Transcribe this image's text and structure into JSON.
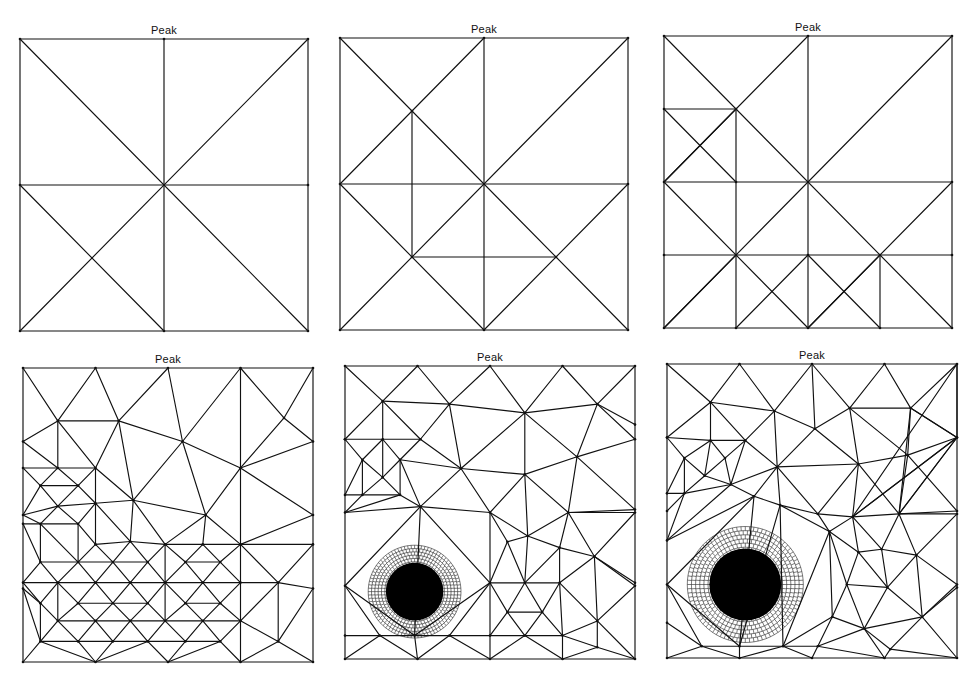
{
  "figure": {
    "panels": [
      {
        "id": 1,
        "title": "Peak",
        "box": {
          "left": 20,
          "top": 39,
          "width": 288,
          "height": 292
        },
        "edges": [
          [
            0,
            0,
            1,
            0
          ],
          [
            1,
            0,
            1,
            1
          ],
          [
            1,
            1,
            0,
            1
          ],
          [
            0,
            1,
            0,
            0
          ],
          [
            0.5,
            0,
            0.5,
            1
          ],
          [
            0,
            0.5,
            1,
            0.5
          ],
          [
            0,
            0,
            1,
            1
          ],
          [
            1,
            0,
            0,
            1
          ],
          [
            0,
            0.5,
            0.5,
            1
          ]
        ]
      },
      {
        "id": 2,
        "title": "Peak",
        "box": {
          "left": 340,
          "top": 38,
          "width": 288,
          "height": 292
        },
        "edges": [
          [
            0,
            0,
            1,
            0
          ],
          [
            1,
            0,
            1,
            1
          ],
          [
            1,
            1,
            0,
            1
          ],
          [
            0,
            1,
            0,
            0
          ],
          [
            0.5,
            0,
            0.5,
            1
          ],
          [
            0,
            0.5,
            1,
            0.5
          ],
          [
            0,
            0,
            1,
            1
          ],
          [
            1,
            0,
            0,
            1
          ],
          [
            0,
            0.5,
            0.5,
            0
          ],
          [
            0.25,
            0.25,
            0.25,
            0.75
          ],
          [
            0,
            0.5,
            0.5,
            1
          ],
          [
            1,
            0.5,
            0.5,
            1
          ],
          [
            0.25,
            0.75,
            0.75,
            0.75
          ]
        ]
      },
      {
        "id": 3,
        "title": "Peak",
        "box": {
          "left": 664,
          "top": 36,
          "width": 288,
          "height": 292
        },
        "edges": [
          [
            0,
            0,
            1,
            0
          ],
          [
            1,
            0,
            1,
            1
          ],
          [
            1,
            1,
            0,
            1
          ],
          [
            0,
            1,
            0,
            0
          ],
          [
            0.5,
            0,
            0.5,
            1
          ],
          [
            0,
            0.5,
            1,
            0.5
          ],
          [
            0,
            0,
            1,
            1
          ],
          [
            1,
            0,
            0,
            1
          ],
          [
            0,
            0.5,
            0.5,
            0
          ],
          [
            0.25,
            0.25,
            0.25,
            1
          ],
          [
            0,
            0.25,
            0.25,
            0.25
          ],
          [
            0,
            0.25,
            0.25,
            0.5
          ],
          [
            0,
            0.5,
            0.25,
            0.25
          ],
          [
            0,
            0.75,
            1,
            0.75
          ],
          [
            0,
            0.5,
            0.5,
            1
          ],
          [
            1,
            0.5,
            0.5,
            1
          ],
          [
            0,
            1,
            0.25,
            0.75
          ],
          [
            0.25,
            1,
            0.5,
            0.75
          ],
          [
            0.5,
            0.75,
            0.75,
            1
          ],
          [
            0.5,
            1,
            0.75,
            0.75
          ],
          [
            0.75,
            0.75,
            0.75,
            1
          ]
        ]
      },
      {
        "id": 4,
        "title": "Peak",
        "box": {
          "left": 23,
          "top": 368,
          "width": 290,
          "height": 294
        },
        "edges": "generated",
        "nodes": [
          [
            0.12,
            0.18
          ],
          [
            0.33,
            0.18
          ],
          [
            0.55,
            0.25
          ],
          [
            0.75,
            0.34
          ],
          [
            0.9,
            0.17
          ],
          [
            0.0,
            0.34
          ],
          [
            0.12,
            0.34
          ],
          [
            0.25,
            0.34
          ],
          [
            0.25,
            0.46
          ],
          [
            0.38,
            0.45
          ],
          [
            0.63,
            0.5
          ],
          [
            0.06,
            0.4
          ],
          [
            0.19,
            0.4
          ],
          [
            0.12,
            0.47
          ],
          [
            0.0,
            0.53
          ],
          [
            0.06,
            0.53
          ],
          [
            0.19,
            0.53
          ],
          [
            0.25,
            0.6
          ],
          [
            0.37,
            0.59
          ],
          [
            0.49,
            0.6
          ],
          [
            0.62,
            0.6
          ],
          [
            0.75,
            0.6
          ],
          [
            1.0,
            0.6
          ],
          [
            0.06,
            0.66
          ],
          [
            0.19,
            0.66
          ],
          [
            0.31,
            0.66
          ],
          [
            0.43,
            0.66
          ],
          [
            0.56,
            0.66
          ],
          [
            0.68,
            0.66
          ],
          [
            0.0,
            0.73
          ],
          [
            0.12,
            0.73
          ],
          [
            0.25,
            0.73
          ],
          [
            0.37,
            0.73
          ],
          [
            0.49,
            0.73
          ],
          [
            0.62,
            0.73
          ],
          [
            0.75,
            0.73
          ],
          [
            0.88,
            0.73
          ],
          [
            0.06,
            0.8
          ],
          [
            0.19,
            0.8
          ],
          [
            0.31,
            0.8
          ],
          [
            0.43,
            0.8
          ],
          [
            0.56,
            0.8
          ],
          [
            0.68,
            0.8
          ],
          [
            0.12,
            0.86
          ],
          [
            0.25,
            0.86
          ],
          [
            0.37,
            0.86
          ],
          [
            0.49,
            0.86
          ],
          [
            0.62,
            0.86
          ],
          [
            0.75,
            0.86
          ],
          [
            0.06,
            0.93
          ],
          [
            0.19,
            0.93
          ],
          [
            0.31,
            0.93
          ],
          [
            0.43,
            0.93
          ],
          [
            0.56,
            0.93
          ],
          [
            0.68,
            0.93
          ],
          [
            0.88,
            0.93
          ]
        ]
      },
      {
        "id": 5,
        "title": "Peak",
        "box": {
          "left": 345,
          "top": 366,
          "width": 290,
          "height": 293
        },
        "edges": "generated",
        "dense_core": {
          "cx": 0.24,
          "cy": 0.77,
          "r": 0.16
        },
        "nodes": [
          [
            0.13,
            0.12
          ],
          [
            0.36,
            0.13
          ],
          [
            0.62,
            0.16
          ],
          [
            0.87,
            0.13
          ],
          [
            0.0,
            0.25
          ],
          [
            0.13,
            0.25
          ],
          [
            0.26,
            0.25
          ],
          [
            0.4,
            0.35
          ],
          [
            0.62,
            0.37
          ],
          [
            0.8,
            0.31
          ],
          [
            1.0,
            0.2
          ],
          [
            0.06,
            0.32
          ],
          [
            0.19,
            0.32
          ],
          [
            0.13,
            0.38
          ],
          [
            0.0,
            0.44
          ],
          [
            0.06,
            0.44
          ],
          [
            0.19,
            0.44
          ],
          [
            0.26,
            0.48
          ],
          [
            0.5,
            0.5
          ],
          [
            0.77,
            0.5
          ],
          [
            1.0,
            0.49
          ],
          [
            0.63,
            0.58
          ],
          [
            0.74,
            0.62
          ],
          [
            0.86,
            0.65
          ],
          [
            0.56,
            0.6
          ],
          [
            0.5,
            0.74
          ],
          [
            0.62,
            0.74
          ],
          [
            0.74,
            0.74
          ],
          [
            1.0,
            0.74
          ],
          [
            0.56,
            0.84
          ],
          [
            0.68,
            0.84
          ],
          [
            0.87,
            0.87
          ],
          [
            0.0,
            0.92
          ],
          [
            0.12,
            0.92
          ],
          [
            0.24,
            0.92
          ],
          [
            0.36,
            0.92
          ],
          [
            0.5,
            0.92
          ],
          [
            0.62,
            0.92
          ],
          [
            0.75,
            0.92
          ],
          [
            0.87,
            0.96
          ]
        ]
      },
      {
        "id": 6,
        "title": "Peak",
        "box": {
          "left": 667,
          "top": 364,
          "width": 290,
          "height": 294
        },
        "edges": "generated",
        "dense_core": {
          "cx": 0.27,
          "cy": 0.75,
          "r": 0.2
        },
        "nodes": [
          [
            0.15,
            0.13
          ],
          [
            0.37,
            0.16
          ],
          [
            0.63,
            0.15
          ],
          [
            0.84,
            0.15
          ],
          [
            0.0,
            0.25
          ],
          [
            0.15,
            0.26
          ],
          [
            0.27,
            0.26
          ],
          [
            0.38,
            0.35
          ],
          [
            0.51,
            0.22
          ],
          [
            0.66,
            0.34
          ],
          [
            0.83,
            0.31
          ],
          [
            1.0,
            0.25
          ],
          [
            0.06,
            0.32
          ],
          [
            0.2,
            0.32
          ],
          [
            0.13,
            0.38
          ],
          [
            0.0,
            0.44
          ],
          [
            0.06,
            0.44
          ],
          [
            0.22,
            0.41
          ],
          [
            0.3,
            0.45
          ],
          [
            0.39,
            0.48
          ],
          [
            0.52,
            0.51
          ],
          [
            0.64,
            0.52
          ],
          [
            0.8,
            0.51
          ],
          [
            1.0,
            0.51
          ],
          [
            0.56,
            0.57
          ],
          [
            0.66,
            0.64
          ],
          [
            0.74,
            0.63
          ],
          [
            0.86,
            0.65
          ],
          [
            0.0,
            0.6
          ],
          [
            0.62,
            0.75
          ],
          [
            0.76,
            0.76
          ],
          [
            1.0,
            0.76
          ],
          [
            0.57,
            0.86
          ],
          [
            0.68,
            0.9
          ],
          [
            0.88,
            0.86
          ],
          [
            0.0,
            0.88
          ],
          [
            0.12,
            0.96
          ],
          [
            0.25,
            0.96
          ],
          [
            0.4,
            0.96
          ],
          [
            0.52,
            0.96
          ],
          [
            0.77,
            0.97
          ]
        ]
      }
    ]
  }
}
